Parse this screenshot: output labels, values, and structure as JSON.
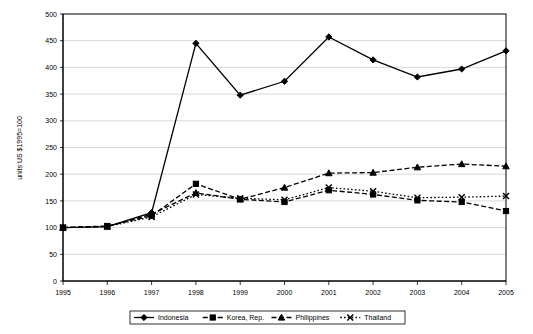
{
  "chart_data": {
    "type": "line",
    "title": "",
    "xlabel": "",
    "ylabel": "units:US $1995=100",
    "categories": [
      "1995",
      "1996",
      "1997",
      "1998",
      "1999",
      "2000",
      "2001",
      "2002",
      "2003",
      "2004",
      "2005"
    ],
    "x": [
      1995,
      1996,
      1997,
      1998,
      1999,
      2000,
      2001,
      2002,
      2003,
      2004,
      2005
    ],
    "ylim": [
      0,
      500
    ],
    "ytick_step": 50,
    "yticks": [
      "0",
      "50",
      "100",
      "150",
      "200",
      "250",
      "300",
      "350",
      "400",
      "450",
      "500"
    ],
    "grid": "horizontal",
    "legend_position": "bottom",
    "series": [
      {
        "name": "Indonesia",
        "marker": "diamond",
        "dash": "solid",
        "color": "#000000",
        "values": [
          100,
          102,
          128,
          445,
          348,
          374,
          457,
          414,
          382,
          397,
          431
        ]
      },
      {
        "name": "Korea, Rep.",
        "marker": "square",
        "dash": "dashed",
        "color": "#000000",
        "values": [
          100,
          103,
          122,
          182,
          153,
          148,
          170,
          162,
          151,
          148,
          131
        ]
      },
      {
        "name": "Philippines",
        "marker": "triangle",
        "dash": "dashed",
        "color": "#000000",
        "values": [
          100,
          102,
          125,
          165,
          153,
          175,
          202,
          203,
          213,
          219,
          215
        ]
      },
      {
        "name": "Thailand",
        "marker": "cross",
        "dash": "dotted",
        "color": "#000000",
        "values": [
          100,
          102,
          120,
          162,
          155,
          152,
          175,
          168,
          156,
          157,
          159
        ]
      }
    ]
  }
}
